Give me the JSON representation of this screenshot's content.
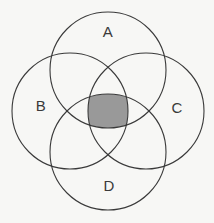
{
  "figure": {
    "background_color": "#f7f7f5",
    "stroke_color": "#3a3a3a",
    "stroke_width": 1.1,
    "shaded_region_color": "#999999",
    "shaded_region_description": "intersection of all four sets"
  },
  "chart_data": {
    "type": "diagram",
    "subtype": "venn",
    "title": "",
    "set_count": 4,
    "canvas": {
      "width": 214,
      "height": 223
    },
    "circle_radius": 58,
    "sets": [
      {
        "id": "A",
        "label": "A",
        "cx": 108,
        "cy": 70,
        "r": 58,
        "label_x": 108,
        "label_y": 33
      },
      {
        "id": "B",
        "label": "B",
        "cx": 70,
        "cy": 111,
        "r": 58,
        "label_x": 41,
        "label_y": 107
      },
      {
        "id": "C",
        "label": "C",
        "cx": 146,
        "cy": 111,
        "r": 58,
        "label_x": 177,
        "label_y": 109
      },
      {
        "id": "D",
        "label": "D",
        "cx": 108,
        "cy": 152,
        "r": 58,
        "label_x": 109,
        "label_y": 187
      }
    ],
    "shaded_regions": [
      {
        "name": "A-and-B-and-C-and-D",
        "members": [
          "A",
          "B",
          "C",
          "D"
        ],
        "fill": "#999999",
        "bounds": {
          "x": 94,
          "y": 97,
          "width": 27,
          "height": 28
        }
      }
    ],
    "legend": null,
    "grid": false,
    "axes": false
  }
}
